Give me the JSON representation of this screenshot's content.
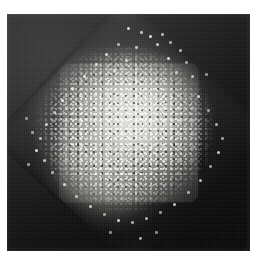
{
  "figure": {
    "kind": "grayscale-micrograph",
    "title": "",
    "caption": "",
    "width_px": 257,
    "height_px": 263
  },
  "plate": {
    "name": "scanned-plate",
    "left_px": 7,
    "top_px": 14,
    "width_px": 243,
    "height_px": 237,
    "background_color": "#0b0b0b",
    "outer_field_color": "#262626"
  },
  "tilted_square": {
    "name": "substrate-window",
    "rotation_deg": 43,
    "size_px": 196,
    "fill_color": "#3a3a3a",
    "visible": true
  },
  "particle_blob": {
    "name": "particle-cluster",
    "shape": "diamond",
    "rotation_deg": 44,
    "width_px": 188,
    "height_px": 190,
    "core_color": "#ebebe8",
    "mid_color": "#a8a8a4",
    "edge_color": "#4a4a48",
    "texture": "granular"
  },
  "margins": {
    "top_px": 14,
    "left_px": 7,
    "right_px": 7,
    "bottom_px": 12,
    "color": "#ffffff"
  },
  "scatter_specks": [
    {
      "x": 118,
      "y": 14,
      "r": 1.6,
      "o": 0.85
    },
    {
      "x": 131,
      "y": 18,
      "r": 1.2,
      "o": 0.7
    },
    {
      "x": 140,
      "y": 22,
      "r": 1.8,
      "o": 0.9
    },
    {
      "x": 152,
      "y": 20,
      "r": 1.3,
      "o": 0.65
    },
    {
      "x": 147,
      "y": 30,
      "r": 1.5,
      "o": 0.8
    },
    {
      "x": 160,
      "y": 28,
      "r": 1.1,
      "o": 0.6
    },
    {
      "x": 126,
      "y": 33,
      "r": 1.4,
      "o": 0.75
    },
    {
      "x": 108,
      "y": 30,
      "r": 1.2,
      "o": 0.62
    },
    {
      "x": 170,
      "y": 36,
      "r": 1.5,
      "o": 0.72
    },
    {
      "x": 158,
      "y": 44,
      "r": 1.9,
      "o": 0.88
    },
    {
      "x": 176,
      "y": 48,
      "r": 1.2,
      "o": 0.58
    },
    {
      "x": 96,
      "y": 40,
      "r": 1.6,
      "o": 0.78
    },
    {
      "x": 86,
      "y": 50,
      "r": 1.3,
      "o": 0.66
    },
    {
      "x": 74,
      "y": 62,
      "r": 1.7,
      "o": 0.82
    },
    {
      "x": 62,
      "y": 74,
      "r": 1.4,
      "o": 0.7
    },
    {
      "x": 52,
      "y": 86,
      "r": 1.8,
      "o": 0.86
    },
    {
      "x": 44,
      "y": 98,
      "r": 1.2,
      "o": 0.6
    },
    {
      "x": 36,
      "y": 110,
      "r": 1.6,
      "o": 0.76
    },
    {
      "x": 30,
      "y": 124,
      "r": 1.3,
      "o": 0.64
    },
    {
      "x": 26,
      "y": 136,
      "r": 1.9,
      "o": 0.88
    },
    {
      "x": 22,
      "y": 118,
      "r": 1.1,
      "o": 0.55
    },
    {
      "x": 34,
      "y": 146,
      "r": 1.5,
      "o": 0.74
    },
    {
      "x": 42,
      "y": 158,
      "r": 1.2,
      "o": 0.62
    },
    {
      "x": 54,
      "y": 170,
      "r": 1.7,
      "o": 0.8
    },
    {
      "x": 66,
      "y": 182,
      "r": 1.3,
      "o": 0.66
    },
    {
      "x": 80,
      "y": 192,
      "r": 1.6,
      "o": 0.78
    },
    {
      "x": 94,
      "y": 200,
      "r": 1.2,
      "o": 0.58
    },
    {
      "x": 108,
      "y": 206,
      "r": 1.8,
      "o": 0.84
    },
    {
      "x": 122,
      "y": 208,
      "r": 1.3,
      "o": 0.64
    },
    {
      "x": 136,
      "y": 204,
      "r": 1.5,
      "o": 0.72
    },
    {
      "x": 150,
      "y": 198,
      "r": 1.2,
      "o": 0.58
    },
    {
      "x": 164,
      "y": 190,
      "r": 1.7,
      "o": 0.8
    },
    {
      "x": 178,
      "y": 178,
      "r": 1.3,
      "o": 0.62
    },
    {
      "x": 190,
      "y": 166,
      "r": 1.6,
      "o": 0.76
    },
    {
      "x": 200,
      "y": 152,
      "r": 1.2,
      "o": 0.56
    },
    {
      "x": 208,
      "y": 138,
      "r": 1.8,
      "o": 0.82
    },
    {
      "x": 212,
      "y": 124,
      "r": 1.3,
      "o": 0.6
    },
    {
      "x": 206,
      "y": 110,
      "r": 1.5,
      "o": 0.7
    },
    {
      "x": 198,
      "y": 96,
      "r": 1.2,
      "o": 0.56
    },
    {
      "x": 188,
      "y": 82,
      "r": 1.7,
      "o": 0.78
    },
    {
      "x": 130,
      "y": 224,
      "r": 1.4,
      "o": 0.68
    },
    {
      "x": 146,
      "y": 218,
      "r": 1.1,
      "o": 0.52
    },
    {
      "x": 100,
      "y": 218,
      "r": 1.2,
      "o": 0.55
    },
    {
      "x": 18,
      "y": 150,
      "r": 1.3,
      "o": 0.58
    },
    {
      "x": 16,
      "y": 104,
      "r": 1.1,
      "o": 0.5
    },
    {
      "x": 196,
      "y": 60,
      "r": 1.2,
      "o": 0.54
    },
    {
      "x": 182,
      "y": 62,
      "r": 1.5,
      "o": 0.7
    },
    {
      "x": 166,
      "y": 58,
      "r": 1.3,
      "o": 0.62
    },
    {
      "x": 116,
      "y": 46,
      "r": 1.6,
      "o": 0.76
    },
    {
      "x": 104,
      "y": 56,
      "r": 1.4,
      "o": 0.68
    }
  ]
}
